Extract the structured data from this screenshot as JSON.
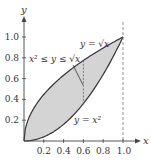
{
  "diagram": {
    "type": "region-between-curves",
    "x_axis_label": "x",
    "y_axis_label": "y",
    "x_ticks": [
      "0.2",
      "0.4",
      "0.6",
      "0.8",
      "1.0"
    ],
    "y_ticks": [
      "0.2",
      "0.4",
      "0.6",
      "0.8",
      "1.0"
    ],
    "upper_curve_label": "y = √x",
    "lower_curve_label": "y = x²",
    "region_label": "x² ≤ y ≤ √x",
    "dashed_line_x": 1.0,
    "sample_segment_x": 0.6,
    "colors": {
      "fill": "#d4d4d4",
      "curve": "#333333",
      "axis": "#444444",
      "dash": "#777777",
      "background": "#ffffff"
    }
  }
}
